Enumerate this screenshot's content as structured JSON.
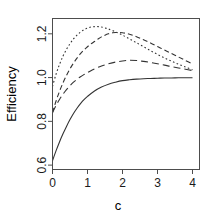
{
  "chart_data": {
    "type": "line",
    "title": "",
    "subtitle": "",
    "xlabel": "c",
    "ylabel": "Efficiency",
    "xlim": [
      0,
      4.2
    ],
    "ylim": [
      0.58,
      1.27
    ],
    "xticks": [
      0,
      1,
      2,
      3,
      4
    ],
    "xtick_labels": [
      "0",
      "1",
      "2",
      "3",
      "4"
    ],
    "yticks": [
      0.6,
      0.8,
      1.0,
      1.2
    ],
    "ytick_labels": [
      "0.6",
      "0.8",
      "1.0",
      "1.2"
    ],
    "grid": false,
    "legend": "none",
    "box": true,
    "series": [
      {
        "name": "solid",
        "linestyle": "solid",
        "dasharray": "",
        "color": "#333333",
        "x": [
          0.0,
          0.1,
          0.2,
          0.3,
          0.4,
          0.5,
          0.6,
          0.7,
          0.8,
          0.9,
          1.0,
          1.2,
          1.4,
          1.6,
          1.8,
          2.0,
          2.2,
          2.4,
          2.6,
          2.8,
          3.0,
          3.2,
          3.4,
          3.6,
          3.8,
          4.0
        ],
        "values": [
          0.62,
          0.665,
          0.706,
          0.743,
          0.777,
          0.808,
          0.836,
          0.86,
          0.881,
          0.899,
          0.914,
          0.939,
          0.957,
          0.97,
          0.979,
          0.986,
          0.99,
          0.993,
          0.995,
          0.996,
          0.997,
          0.998,
          0.998,
          0.999,
          0.999,
          0.999
        ]
      },
      {
        "name": "long-dash",
        "linestyle": "dashed-long",
        "dasharray": "7,4",
        "color": "#333333",
        "x": [
          0.0,
          0.1,
          0.2,
          0.3,
          0.4,
          0.5,
          0.6,
          0.7,
          0.8,
          0.9,
          1.0,
          1.2,
          1.4,
          1.6,
          1.8,
          2.0,
          2.1,
          2.2,
          2.4,
          2.6,
          2.8,
          3.0,
          3.2,
          3.4,
          3.6,
          3.8,
          4.0
        ],
        "values": [
          0.84,
          0.872,
          0.9,
          0.924,
          0.945,
          0.963,
          0.979,
          0.992,
          1.004,
          1.014,
          1.023,
          1.04,
          1.053,
          1.063,
          1.071,
          1.076,
          1.078,
          1.079,
          1.078,
          1.074,
          1.069,
          1.063,
          1.057,
          1.05,
          1.044,
          1.038,
          1.032
        ]
      },
      {
        "name": "short-dash",
        "linestyle": "dashed-short",
        "dasharray": "5,3",
        "color": "#333333",
        "x": [
          0.0,
          0.1,
          0.2,
          0.3,
          0.4,
          0.5,
          0.6,
          0.7,
          0.8,
          0.9,
          1.0,
          1.1,
          1.2,
          1.3,
          1.4,
          1.5,
          1.6,
          1.7,
          1.8,
          2.0,
          2.2,
          2.4,
          2.6,
          2.8,
          3.0,
          3.2,
          3.4,
          3.6,
          3.8,
          4.0
        ],
        "values": [
          0.84,
          0.892,
          0.937,
          0.976,
          1.01,
          1.04,
          1.066,
          1.089,
          1.109,
          1.126,
          1.141,
          1.154,
          1.165,
          1.176,
          1.186,
          1.194,
          1.2,
          1.204,
          1.206,
          1.205,
          1.198,
          1.187,
          1.173,
          1.158,
          1.142,
          1.126,
          1.11,
          1.094,
          1.078,
          1.062
        ]
      },
      {
        "name": "dotted",
        "linestyle": "dotted",
        "dasharray": "1.6,2.4",
        "color": "#333333",
        "x": [
          0.0,
          0.1,
          0.2,
          0.3,
          0.4,
          0.5,
          0.6,
          0.7,
          0.8,
          0.9,
          1.0,
          1.1,
          1.2,
          1.3,
          1.4,
          1.5,
          1.6,
          1.8,
          2.0,
          2.2,
          2.4,
          2.6,
          2.8,
          3.0,
          3.2,
          3.4,
          3.6,
          3.8,
          4.0
        ],
        "values": [
          0.96,
          1.015,
          1.06,
          1.098,
          1.129,
          1.155,
          1.177,
          1.194,
          1.208,
          1.219,
          1.226,
          1.231,
          1.233,
          1.233,
          1.231,
          1.227,
          1.222,
          1.209,
          1.194,
          1.177,
          1.159,
          1.141,
          1.123,
          1.106,
          1.09,
          1.075,
          1.061,
          1.048,
          1.036
        ]
      }
    ]
  },
  "axes": {
    "x_title": "c",
    "y_title": "Efficiency"
  }
}
